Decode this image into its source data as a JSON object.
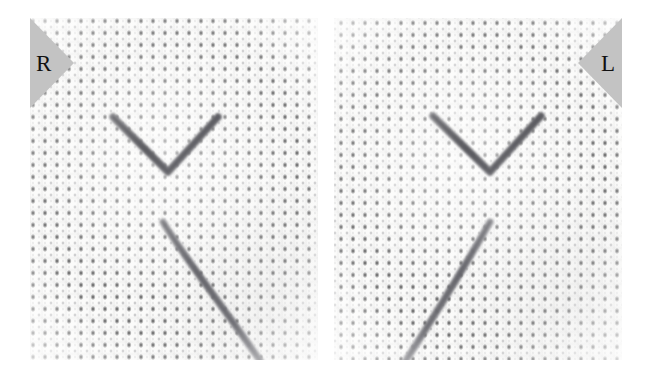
{
  "figure": {
    "caption_absent": true,
    "background_color": "#ffffff",
    "panel_count": 2
  },
  "panels": [
    {
      "id": "panel-right-eye",
      "label": "R",
      "label_position": "top-left",
      "label_triangle_color": "#c3c3c3",
      "label_text_color": "#111111",
      "subject": "white aida-weave fabric with dark suture threads",
      "fabric_color": "#fbfbfa",
      "weave_dot_color": "#28282a",
      "weave_pitch_px": 12,
      "threads": [
        {
          "name": "chevron-suture",
          "shape": "v",
          "color": "#6e6e72",
          "points": "83,99 138,154 188,99"
        },
        {
          "name": "diagonal-suture",
          "shape": "line",
          "color": "#76767a",
          "points": "133,204 231,342"
        }
      ]
    },
    {
      "id": "panel-left-eye",
      "label": "L",
      "label_position": "top-right",
      "label_triangle_color": "#c3c3c3",
      "label_text_color": "#111111",
      "subject": "white aida-weave fabric with dark suture threads",
      "fabric_color": "#fbfbfa",
      "weave_dot_color": "#28282a",
      "weave_pitch_px": 12,
      "threads": [
        {
          "name": "chevron-suture",
          "shape": "v",
          "color": "#6e6e72",
          "points": "99,98 156,154 207,98"
        },
        {
          "name": "diagonal-suture",
          "shape": "line",
          "color": "#76767a",
          "points": "156,204 71,342"
        }
      ]
    }
  ]
}
